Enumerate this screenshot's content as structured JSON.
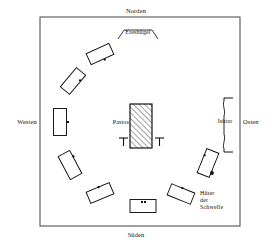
{
  "diagram": {
    "directions": {
      "north": "Norden",
      "east": "Osten",
      "south": "Süden",
      "west": "Westen"
    },
    "labels": {
      "mound": "Ereshügel",
      "center_object": "Pastos",
      "east_gate": "Ishtar",
      "guardian_line1": "Hüter",
      "guardian_line2": "der",
      "guardian_line3": "Schwelle"
    },
    "colors": {
      "ink": "#111111",
      "frame": "#555555",
      "hatch": "#333333",
      "paper": "#ffffff"
    },
    "frame": {
      "x": 40,
      "y": 17,
      "width": 200,
      "height": 209
    },
    "center_object": {
      "name": "Pastos",
      "shape": "hatched-rectangle",
      "x": 130,
      "y": 104,
      "width": 22,
      "height": 44,
      "hatch_angle_deg": 45,
      "markers": [
        {
          "name": "t-marker-left",
          "x": 123,
          "y": 139
        },
        {
          "name": "t-marker-right",
          "x": 159,
          "y": 139
        }
      ]
    },
    "mound_arc": {
      "name": "Ereshügel",
      "points": "118,39 124,30 152,30 158,39"
    },
    "ishtar_brace": {
      "name": "Ishtar",
      "top_tick_y": 98,
      "bottom_tick_y": 152,
      "tick_x_start": 224,
      "tick_x_end": 233
    },
    "guardian_dot": {
      "x": 212,
      "y": 173,
      "r": 1.9
    },
    "seats": [
      {
        "id": "seat-nw-upper",
        "cx": 100,
        "cy": 54,
        "w": 25,
        "h": 12,
        "rot": -25,
        "dots": [
          {
            "dx": 2,
            "dy": 7
          }
        ]
      },
      {
        "id": "seat-nw-lower",
        "cx": 73,
        "cy": 81,
        "w": 25,
        "h": 12,
        "rot": -50,
        "dots": [
          {
            "dx": 5,
            "dy": 5
          }
        ]
      },
      {
        "id": "seat-w",
        "cx": 60,
        "cy": 122,
        "w": 13,
        "h": 27,
        "rot": 0,
        "dots": [
          {
            "dx": 8,
            "dy": 0
          }
        ]
      },
      {
        "id": "seat-sw-upper",
        "cx": 70,
        "cy": 165,
        "w": 13,
        "h": 26,
        "rot": -28,
        "dots": [
          {
            "dx": 7,
            "dy": -6
          }
        ]
      },
      {
        "id": "seat-sw-lower",
        "cx": 100,
        "cy": 193,
        "w": 25,
        "h": 12,
        "rot": -23,
        "dots": [
          {
            "dx": 1,
            "dy": -6
          }
        ]
      },
      {
        "id": "seat-s",
        "cx": 143,
        "cy": 206,
        "w": 26,
        "h": 13,
        "rot": 0,
        "dots": [
          {
            "dx": -1,
            "dy": -4
          },
          {
            "dx": 2,
            "dy": -4
          }
        ]
      },
      {
        "id": "seat-se",
        "cx": 181,
        "cy": 194,
        "w": 25,
        "h": 12,
        "rot": 22,
        "dots": [
          {
            "dx": -1,
            "dy": -6
          }
        ]
      },
      {
        "id": "seat-e",
        "cx": 208,
        "cy": 163,
        "w": 13,
        "h": 26,
        "rot": 22,
        "dots": [
          {
            "dx": -6,
            "dy": -6
          }
        ]
      }
    ]
  }
}
